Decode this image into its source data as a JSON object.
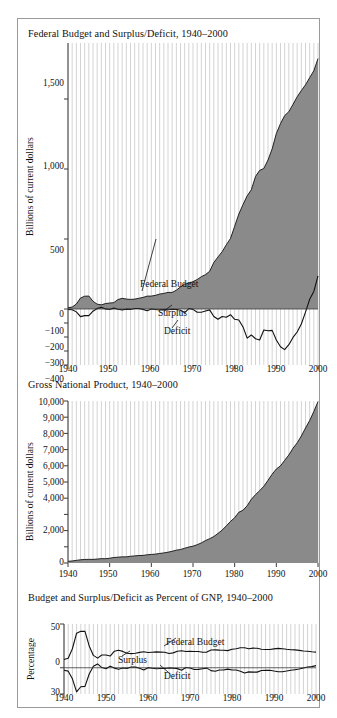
{
  "figure": {
    "panels": [
      {
        "id": "federal-budget",
        "title": "Federal Budget and Surplus/Deficit, 1940–2000",
        "ylabel": "Billions of current dollars",
        "yticks": [
          "1,500",
          "1,000",
          "500",
          "0",
          "−100",
          "−200",
          "−300",
          "−400"
        ],
        "xticks": [
          "1940",
          "1950",
          "1960",
          "1970",
          "1980",
          "1990",
          "2000"
        ],
        "annotations": [
          "Federal Budget",
          "Surplus",
          "Deficit"
        ]
      },
      {
        "id": "gross-national-product",
        "title": "Gross National Product, 1940–2000",
        "ylabel": "Billions of current dollars",
        "yticks": [
          "10,000",
          "9,000",
          "8,000",
          "7,000",
          "6,000",
          "5,000",
          "4,000",
          "2,000",
          "0"
        ],
        "xticks": [
          "1940",
          "1950",
          "1960",
          "1970",
          "1980",
          "1990",
          "2000"
        ],
        "annotations": []
      },
      {
        "id": "percent-of-gnp",
        "title": "Budget and Surplus/Deficit as Percent of GNP, 1940–2000",
        "ylabel": "Percentage",
        "yticks": [
          "50",
          "0",
          "30"
        ],
        "xticks": [
          "1940",
          "1950",
          "1960",
          "1970",
          "1980",
          "1990",
          "2000"
        ],
        "annotations": [
          "Federal Budget",
          "Surplus",
          "Deficit"
        ]
      }
    ]
  },
  "colors": {
    "area_fill": "#8a8a8a",
    "gridline": "#d3d3d3",
    "axis": "#3a3a3a",
    "line": "#111111",
    "border": "#9a9a9a",
    "background": "#ffffff"
  },
  "chart_data": [
    {
      "type": "area",
      "title": "Federal Budget and Surplus/Deficit, 1940–2000",
      "xlabel": "",
      "ylabel": "Billions of current dollars",
      "xlim": [
        1940,
        2000
      ],
      "ylim": [
        -400,
        1900
      ],
      "grid": "vertical-yearly",
      "yticks": [
        -400,
        -300,
        -200,
        -100,
        0,
        500,
        1000,
        1500
      ],
      "ytick_labels": [
        "−400",
        "−300",
        "−200",
        "−100",
        "0",
        "500",
        "1,000",
        "1,500"
      ],
      "xticks": [
        1940,
        1950,
        1960,
        1970,
        1980,
        1990,
        2000
      ],
      "x": [
        1940,
        1941,
        1942,
        1943,
        1944,
        1945,
        1946,
        1947,
        1948,
        1949,
        1950,
        1951,
        1952,
        1953,
        1954,
        1955,
        1956,
        1957,
        1958,
        1959,
        1960,
        1961,
        1962,
        1963,
        1964,
        1965,
        1966,
        1967,
        1968,
        1969,
        1970,
        1971,
        1972,
        1973,
        1974,
        1975,
        1976,
        1977,
        1978,
        1979,
        1980,
        1981,
        1982,
        1983,
        1984,
        1985,
        1986,
        1987,
        1988,
        1989,
        1990,
        1991,
        1992,
        1993,
        1994,
        1995,
        1996,
        1997,
        1998,
        1999,
        2000
      ],
      "series": [
        {
          "name": "Federal Budget",
          "kind": "area",
          "values": [
            9.5,
            13.7,
            35.1,
            78.6,
            91.3,
            92.7,
            55.2,
            34.5,
            29.8,
            38.8,
            42.6,
            45.5,
            67.7,
            76.1,
            70.9,
            68.4,
            70.6,
            76.6,
            82.4,
            92.1,
            92.2,
            97.7,
            106.8,
            111.3,
            118.5,
            118.2,
            134.5,
            157.5,
            178.1,
            183.6,
            195.6,
            210.2,
            230.7,
            245.7,
            269.4,
            332.3,
            371.8,
            409.2,
            458.7,
            504.0,
            590.9,
            678.2,
            745.7,
            808.4,
            851.8,
            946.4,
            990.3,
            1004.0,
            1064.4,
            1143.7,
            1253.2,
            1324.4,
            1381.5,
            1409.4,
            1461.7,
            1515.7,
            1560.5,
            1601.1,
            1652.5,
            1701.8,
            1788.8
          ]
        },
        {
          "name": "Surplus/Deficit",
          "kind": "line",
          "values": [
            -2.9,
            -4.9,
            -20.5,
            -54.6,
            -47.6,
            -47.6,
            -15.9,
            4.0,
            11.8,
            0.6,
            -3.1,
            6.1,
            -1.5,
            -6.5,
            -1.2,
            -3.0,
            3.9,
            3.4,
            -2.8,
            -12.8,
            0.3,
            -3.3,
            -7.1,
            -4.8,
            -5.9,
            -1.4,
            -3.7,
            -8.6,
            -25.2,
            3.2,
            -2.8,
            -23.0,
            -23.4,
            -14.9,
            -6.1,
            -53.2,
            -73.7,
            -53.7,
            -59.2,
            -40.7,
            -73.8,
            -79.0,
            -128.0,
            -207.8,
            -185.4,
            -212.3,
            -221.2,
            -149.7,
            -155.2,
            -152.6,
            -221.0,
            -269.2,
            -290.3,
            -255.1,
            -203.2,
            -164.0,
            -107.4,
            -21.9,
            69.3,
            125.6,
            236.4
          ]
        }
      ],
      "annotations": [
        {
          "text": "Federal Budget",
          "year": 1960,
          "note": "leader line to budget area boundary"
        },
        {
          "text": "Surplus",
          "year": 1960,
          "note": "leader line to surplus/deficit line above zero"
        },
        {
          "text": "Deficit",
          "year": 1963,
          "note": "leader line to surplus/deficit line below zero"
        }
      ]
    },
    {
      "type": "area",
      "title": "Gross National Product, 1940–2000",
      "xlabel": "",
      "ylabel": "Billions of current dollars",
      "xlim": [
        1940,
        2000
      ],
      "ylim": [
        0,
        10000
      ],
      "grid": "vertical-yearly",
      "yticks": [
        0,
        1000,
        2000,
        3000,
        4000,
        5000,
        6000,
        7000,
        8000,
        9000,
        10000
      ],
      "ytick_labels": [
        "0",
        "",
        "2,000",
        "",
        "4,000",
        "5,000",
        "6,000",
        "7,000",
        "8,000",
        "9,000",
        "10,000"
      ],
      "xticks": [
        1940,
        1950,
        1960,
        1970,
        1980,
        1990,
        2000
      ],
      "x": [
        1940,
        1941,
        1942,
        1943,
        1944,
        1945,
        1946,
        1947,
        1948,
        1949,
        1950,
        1951,
        1952,
        1953,
        1954,
        1955,
        1956,
        1957,
        1958,
        1959,
        1960,
        1961,
        1962,
        1963,
        1964,
        1965,
        1966,
        1967,
        1968,
        1969,
        1970,
        1971,
        1972,
        1973,
        1974,
        1975,
        1976,
        1977,
        1978,
        1979,
        1980,
        1981,
        1982,
        1983,
        1984,
        1985,
        1986,
        1987,
        1988,
        1989,
        1990,
        1991,
        1992,
        1993,
        1994,
        1995,
        1996,
        1997,
        1998,
        1999,
        2000
      ],
      "series": [
        {
          "name": "Gross National Product",
          "kind": "area",
          "values": [
            101,
            127,
            162,
            199,
            219,
            223,
            222,
            244,
            270,
            267,
            294,
            339,
            358,
            379,
            380,
            415,
            438,
            461,
            467,
            507,
            529,
            548,
            589,
            622,
            668,
            724,
            792,
            834,
            911,
            985,
            1039,
            1128,
            1240,
            1385,
            1501,
            1635,
            1824,
            2031,
            2295,
            2566,
            2796,
            3131,
            3259,
            3535,
            3933,
            4220,
            4463,
            4740,
            5104,
            5484,
            5803,
            5996,
            6338,
            6668,
            7085,
            7415,
            7839,
            8332,
            8794,
            9354,
            9963
          ]
        }
      ],
      "annotations": []
    },
    {
      "type": "line",
      "title": "Budget and Surplus/Deficit as Percent of GNP, 1940–2000",
      "xlabel": "",
      "ylabel": "Percentage",
      "xlim": [
        1940,
        2000
      ],
      "ylim": [
        -30,
        50
      ],
      "grid": "vertical-yearly",
      "yticks": [
        -30,
        0,
        50
      ],
      "ytick_labels": [
        "30",
        "0",
        "50"
      ],
      "xticks": [
        1940,
        1950,
        1960,
        1970,
        1980,
        1990,
        2000
      ],
      "x": [
        1940,
        1941,
        1942,
        1943,
        1944,
        1945,
        1946,
        1947,
        1948,
        1949,
        1950,
        1951,
        1952,
        1953,
        1954,
        1955,
        1956,
        1957,
        1958,
        1959,
        1960,
        1961,
        1962,
        1963,
        1964,
        1965,
        1966,
        1967,
        1968,
        1969,
        1970,
        1971,
        1972,
        1973,
        1974,
        1975,
        1976,
        1977,
        1978,
        1979,
        1980,
        1981,
        1982,
        1983,
        1984,
        1985,
        1986,
        1987,
        1988,
        1989,
        1990,
        1991,
        1992,
        1993,
        1994,
        1995,
        1996,
        1997,
        1998,
        1999,
        2000
      ],
      "series": [
        {
          "name": "Federal Budget",
          "kind": "line",
          "values": [
            9.4,
            10.8,
            21.7,
            39.5,
            41.7,
            41.6,
            24.9,
            14.1,
            11.0,
            14.5,
            14.5,
            13.4,
            18.9,
            20.1,
            18.7,
            16.5,
            16.1,
            16.6,
            17.6,
            18.2,
            17.4,
            17.8,
            18.1,
            17.9,
            17.7,
            16.3,
            17.0,
            18.9,
            19.5,
            18.6,
            18.8,
            18.6,
            18.6,
            17.7,
            17.9,
            20.3,
            20.4,
            20.1,
            20.0,
            19.6,
            21.1,
            21.7,
            22.9,
            22.9,
            21.7,
            22.4,
            22.2,
            21.2,
            20.9,
            20.9,
            21.6,
            22.1,
            21.8,
            21.1,
            20.6,
            20.4,
            19.9,
            19.2,
            18.8,
            18.2,
            17.9
          ]
        },
        {
          "name": "Surplus/Deficit",
          "kind": "line",
          "values": [
            -2.9,
            -3.9,
            -12.7,
            -27.5,
            -21.7,
            -21.3,
            -7.2,
            1.6,
            4.4,
            0.2,
            -1.1,
            1.8,
            -0.4,
            -1.7,
            -0.3,
            -0.7,
            0.9,
            0.7,
            -0.6,
            -2.5,
            0.1,
            -0.6,
            -1.2,
            -0.8,
            -0.9,
            -0.2,
            -0.5,
            -1.0,
            -2.8,
            0.3,
            -0.3,
            -2.0,
            -1.9,
            -1.1,
            -0.4,
            -3.3,
            -4.0,
            -2.6,
            -2.6,
            -1.6,
            -2.6,
            -2.5,
            -3.9,
            -5.9,
            -4.7,
            -5.0,
            -5.0,
            -3.2,
            -3.0,
            -2.8,
            -3.8,
            -4.5,
            -4.6,
            -3.8,
            -2.9,
            -2.2,
            -1.4,
            -0.3,
            0.8,
            1.3,
            2.4
          ]
        }
      ],
      "annotations": [
        {
          "text": "Federal Budget",
          "year": 1966,
          "note": "leader line to budget line"
        },
        {
          "text": "Surplus",
          "year": 1954,
          "note": "leader line to zero region"
        },
        {
          "text": "Deficit",
          "year": 1968,
          "note": "leader line to deficit line"
        }
      ]
    }
  ]
}
